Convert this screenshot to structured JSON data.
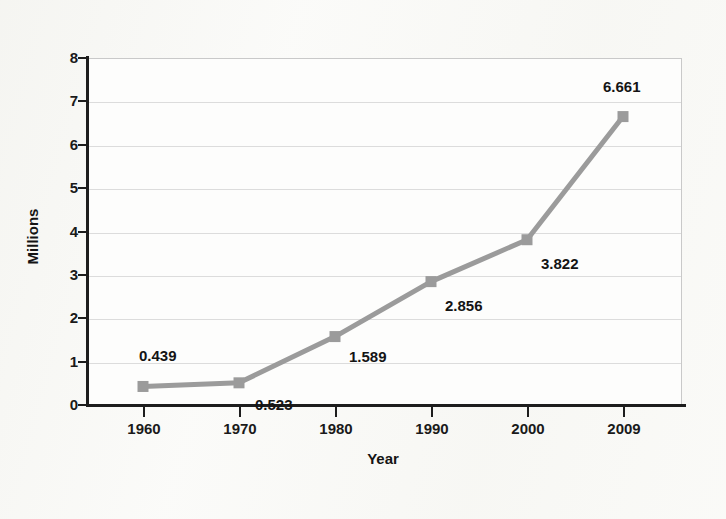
{
  "chart_data": {
    "type": "line",
    "title": "",
    "xlabel": "Year",
    "ylabel": "Millions",
    "categories": [
      "1960",
      "1970",
      "1980",
      "1990",
      "2000",
      "2009"
    ],
    "values": [
      0.439,
      0.523,
      1.589,
      2.856,
      3.822,
      6.661
    ],
    "point_labels": [
      "0.439",
      "0.523",
      "1.589",
      "2.856",
      "3.822",
      "6.661"
    ],
    "series": [
      {
        "name": "Millions",
        "values": [
          0.439,
          0.523,
          1.589,
          2.856,
          3.822,
          6.661
        ]
      }
    ],
    "ylim": [
      0,
      8
    ],
    "yticks": [
      "0",
      "1",
      "2",
      "3",
      "4",
      "5",
      "6",
      "7",
      "8"
    ],
    "xticks": [
      "1960",
      "1970",
      "1980",
      "1990",
      "2000",
      "2009"
    ],
    "grid": true,
    "legend": "none",
    "line_color": "#9b9b9b",
    "marker_color": "#9b9b9b",
    "marker_shape": "square",
    "axis_color": "#1d1d1d",
    "gridline_color": "#dcdcdc",
    "background_color": "#fafaf8",
    "plot_background_color": "#fdfdfc",
    "text_color": "#141414"
  }
}
